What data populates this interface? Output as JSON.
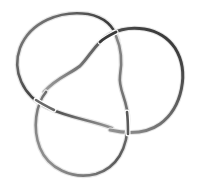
{
  "figure": {
    "title": "Trefoil knot",
    "colors": {
      "background": "#ffffff",
      "tube_dark": "#2a2a2a",
      "tube_mid": "#6e6e6e",
      "tube_light": "#c8c8c8"
    },
    "lobes": [
      "top-left-lobe",
      "right-lobe",
      "bottom-lobe"
    ],
    "crossings": 3
  }
}
